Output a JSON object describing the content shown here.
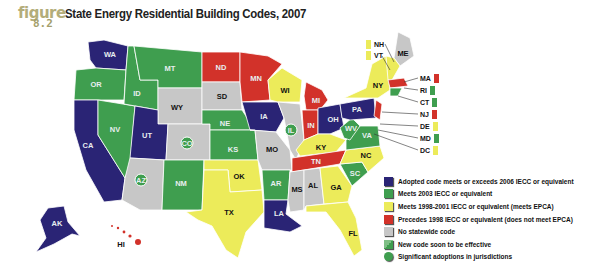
{
  "figure": {
    "word": "figure",
    "number": "8.2"
  },
  "title": "State Energy Residential Building Codes, 2007",
  "colors": {
    "exceeds_2006": "#2a2475",
    "meets_2003": "#3f9e4f",
    "meets_1998_2001": "#eceb5a",
    "precedes_1998": "#d2322a",
    "no_code": "#c7c7c7",
    "new_code_soon": "#3f9e4f",
    "jurisdictions": "#3f9e4f"
  },
  "legend": [
    {
      "key": "exceeds_2006",
      "label": "Adopted code meets or exceeds 2006 IECC or equivalent",
      "shape": "square",
      "color": "#2a2475"
    },
    {
      "key": "meets_2003",
      "label": "Meets 2003 IECC or equivalent",
      "shape": "square",
      "color": "#3f9e4f"
    },
    {
      "key": "meets_1998_2001",
      "label": "Meets 1998-2001 IECC or equivalent (meets EPCA)",
      "shape": "square",
      "color": "#eceb5a"
    },
    {
      "key": "precedes_1998",
      "label": "Precedes 1998 IECC or equivalent (does not meet EPCA)",
      "shape": "square",
      "color": "#d2322a"
    },
    {
      "key": "no_code",
      "label": "No statewide code",
      "shape": "square",
      "color": "#c7c7c7"
    },
    {
      "key": "new_code_soon",
      "label": "New code soon to be effective",
      "shape": "split",
      "color": "#3f9e4f"
    },
    {
      "key": "jurisdictions",
      "label": "Significant adoptions in jurisdictions",
      "shape": "circle",
      "color": "#3f9e4f"
    }
  ],
  "northeast_callouts": [
    {
      "state": "NH",
      "color": "#eceb5a"
    },
    {
      "state": "VT",
      "color": "#eceb5a"
    },
    {
      "state": "MA",
      "color": "#d2322a"
    },
    {
      "state": "RI",
      "color": "#3f9e4f"
    },
    {
      "state": "CT",
      "color": "#3f9e4f"
    },
    {
      "state": "NJ",
      "color": "#d2322a"
    },
    {
      "state": "DE",
      "color": "#eceb5a"
    },
    {
      "state": "MD",
      "color": "#3f9e4f"
    },
    {
      "state": "DC",
      "color": "#eceb5a"
    }
  ],
  "states": {
    "WA": "exceeds_2006",
    "OR": "meets_2003",
    "CA": "exceeds_2006",
    "ID": "meets_2003",
    "NV": "meets_2003",
    "MT": "meets_2003",
    "WY": "no_code",
    "UT": "exceeds_2006",
    "CO": "no_code (jurisdictions)",
    "AZ": "no_code (jurisdictions)",
    "NM": "meets_2003",
    "ND": "precedes_1998",
    "SD": "no_code",
    "NE": "meets_2003",
    "KS": "meets_2003",
    "OK": "meets_1998_2001",
    "TX": "meets_1998_2001",
    "MN": "precedes_1998",
    "IA": "exceeds_2006",
    "MO": "no_code",
    "AR": "meets_2003",
    "LA": "exceeds_2006",
    "WI": "meets_1998_2001",
    "IL": "no_code (jurisdictions)",
    "MI": "precedes_1998",
    "IN": "precedes_1998",
    "OH": "exceeds_2006",
    "KY": "meets_1998_2001",
    "TN": "precedes_1998",
    "MS": "no_code",
    "AL": "no_code",
    "GA": "meets_1998_2001",
    "FL": "meets_1998_2001",
    "SC": "meets_2003",
    "NC": "meets_1998_2001",
    "VA": "meets_2003",
    "WV": "meets_2003",
    "PA": "exceeds_2006",
    "NY": "meets_1998_2001",
    "ME": "no_code",
    "AK": "exceeds_2006",
    "HI": "precedes_1998"
  },
  "labels": {
    "WA": "WA",
    "OR": "OR",
    "CA": "CA",
    "ID": "ID",
    "NV": "NV",
    "MT": "MT",
    "WY": "WY",
    "UT": "UT",
    "CO": "CO",
    "AZ": "AZ",
    "NM": "NM",
    "ND": "ND",
    "SD": "SD",
    "NE": "NE",
    "KS": "KS",
    "OK": "OK",
    "TX": "TX",
    "MN": "MN",
    "IA": "IA",
    "MO": "MO",
    "AR": "AR",
    "LA": "LA",
    "WI": "WI",
    "IL": "IL",
    "MI": "MI",
    "IN": "IN",
    "OH": "OH",
    "KY": "KY",
    "TN": "TN",
    "MS": "MS",
    "AL": "AL",
    "GA": "GA",
    "FL": "FL",
    "SC": "SC",
    "NC": "NC",
    "VA": "VA",
    "WV": "WV",
    "PA": "PA",
    "NY": "NY",
    "ME": "ME",
    "AK": "AK",
    "HI": "HI"
  }
}
